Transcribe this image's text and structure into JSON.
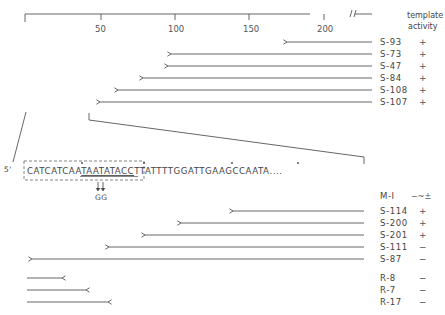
{
  "figure": {
    "scale": {
      "ticks": [
        {
          "label": "50",
          "value": 50
        },
        {
          "label": "100",
          "value": 100
        },
        {
          "label": "150",
          "value": 150
        },
        {
          "label": "200",
          "value": 200
        }
      ],
      "break_symbol": "//"
    },
    "header": {
      "line1": "template",
      "line2": "activity"
    },
    "upper_clones": [
      {
        "name": "S-93",
        "activity": "+"
      },
      {
        "name": "S-73",
        "activity": "+"
      },
      {
        "name": "S-47",
        "activity": "+"
      },
      {
        "name": "S-84",
        "activity": "+"
      },
      {
        "name": "S-108",
        "activity": "+"
      },
      {
        "name": "S-107",
        "activity": "+"
      }
    ],
    "sequence": {
      "prime": "5'",
      "boxed_pre": "CATCATCAA",
      "underlined": "TAATATACC",
      "boxed_post": "TT",
      "rest": "ATTTTGGATTGAAGCCAATA",
      "ellipsis": "....",
      "mutation_label": "GG"
    },
    "mutant": {
      "name": "M-I",
      "activity": "−~±"
    },
    "lower_clones": [
      {
        "name": "S-114",
        "activity": "+"
      },
      {
        "name": "S-200",
        "activity": "+"
      },
      {
        "name": "S-201",
        "activity": "+"
      },
      {
        "name": "S-111",
        "activity": "−"
      },
      {
        "name": "S-87",
        "activity": "−"
      }
    ],
    "reverse_clones": [
      {
        "name": "R-8",
        "activity": "−"
      },
      {
        "name": "R-7",
        "activity": "−"
      },
      {
        "name": "R-17",
        "activity": "−"
      }
    ]
  }
}
